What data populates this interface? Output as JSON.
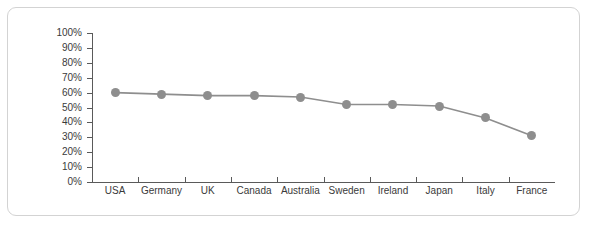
{
  "chart_data": {
    "type": "line",
    "title": "",
    "subtitle": "",
    "xlabel": "",
    "ylabel": "",
    "categories": [
      "USA",
      "Germany",
      "UK",
      "Canada",
      "Australia",
      "Sweden",
      "Ireland",
      "Japan",
      "Italy",
      "France"
    ],
    "values": [
      60,
      59,
      58,
      58,
      57,
      52,
      52,
      51,
      43,
      31
    ],
    "series": [
      {
        "name": "",
        "values": [
          60,
          59,
          58,
          58,
          57,
          52,
          52,
          51,
          43,
          31
        ]
      }
    ],
    "ylim": [
      0,
      100
    ],
    "ytick_values": [
      0,
      10,
      20,
      30,
      40,
      50,
      60,
      70,
      80,
      90,
      100
    ],
    "ytick_labels": [
      "0%",
      "10%",
      "20%",
      "30%",
      "40%",
      "50%",
      "60%",
      "70%",
      "80%",
      "90%",
      "100%"
    ],
    "grid": false,
    "legend": null,
    "legend_position": "none",
    "annotations": [],
    "colors": {
      "line": "#8e8e8e",
      "marker": "#8e8e8e",
      "axis": "#5a5a5a",
      "tick_text": "#3a3a3a",
      "panel_border": "#d3d3d3",
      "background": "#ffffff"
    }
  }
}
